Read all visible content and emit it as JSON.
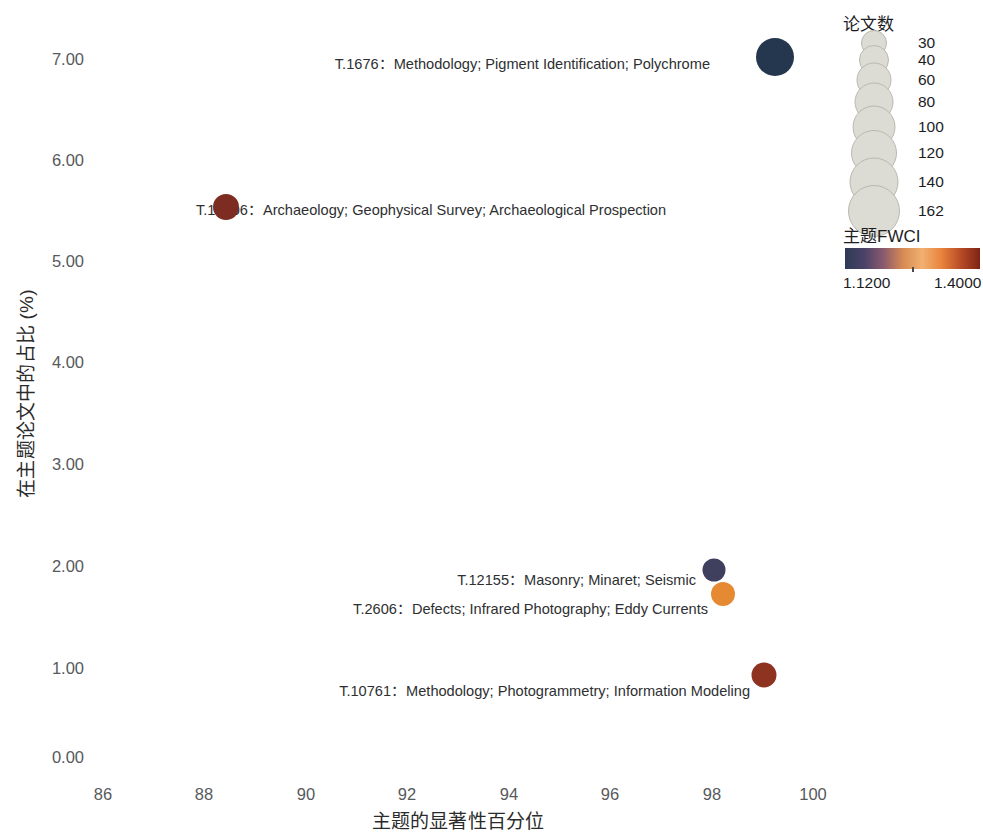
{
  "chart_data": {
    "type": "scatter",
    "title": "",
    "xlabel": "主题的显著性百分位",
    "ylabel": "在主题论文中的占比 (%)",
    "xlim": [
      85,
      101
    ],
    "ylim": [
      0,
      7.4
    ],
    "x_ticks": [
      "86",
      "88",
      "90",
      "92",
      "94",
      "96",
      "98",
      "100"
    ],
    "x_tick_values": [
      86,
      88,
      90,
      92,
      94,
      96,
      98,
      100
    ],
    "y_ticks": [
      "0.00",
      "1.00",
      "2.00",
      "3.00",
      "4.00",
      "5.00",
      "6.00",
      "7.00"
    ],
    "y_tick_values": [
      0,
      1,
      2,
      3,
      4,
      5,
      6,
      7
    ],
    "grid": false,
    "legend_position": "right",
    "points": [
      {
        "label": "T.1676：Methodology; Pigment Identification; Polychrome",
        "x": 99.25,
        "y": 7.02,
        "papers": 162,
        "fwci": 1.12,
        "color": "#24374f",
        "diameter": 38
      },
      {
        "label": "T.12406：Archaeology; Geophysical Survey; Archaeological Prospection",
        "x": 88.43,
        "y": 5.52,
        "papers": 60,
        "fwci": 1.4,
        "color": "#7c2c20",
        "diameter": 26
      },
      {
        "label": "T.12155：Masonry; Minaret; Seismic",
        "x": 98.05,
        "y": 1.88,
        "papers": 40,
        "fwci": 1.16,
        "color": "#3f3f5e",
        "diameter": 23
      },
      {
        "label": "T.2606：Defects; Infrared Photography; Eddy Currents",
        "x": 98.22,
        "y": 1.63,
        "papers": 45,
        "fwci": 1.3,
        "color": "#e58a33",
        "diameter": 24
      },
      {
        "label": "T.10761：Methodology; Photogrammetry; Information Modeling",
        "x": 99.03,
        "y": 0.82,
        "papers": 50,
        "fwci": 1.39,
        "color": "#8e3320",
        "diameter": 25
      }
    ]
  },
  "size_legend": {
    "title": "论文数",
    "items": [
      {
        "label": "30",
        "diameter": 26
      },
      {
        "label": "40",
        "diameter": 30
      },
      {
        "label": "60",
        "diameter": 35
      },
      {
        "label": "80",
        "diameter": 39
      },
      {
        "label": "100",
        "diameter": 43
      },
      {
        "label": "120",
        "diameter": 46
      },
      {
        "label": "140",
        "diameter": 49
      },
      {
        "label": "162",
        "diameter": 52
      }
    ]
  },
  "color_legend": {
    "title": "主题FWCI",
    "min_label": "1.1200",
    "max_label": "1.4000",
    "gradient_stops": [
      "#2d3b55",
      "#4b4268",
      "#8a5a6e",
      "#d78a52",
      "#f2b071",
      "#e8843c",
      "#b84b26",
      "#7d2414"
    ]
  }
}
